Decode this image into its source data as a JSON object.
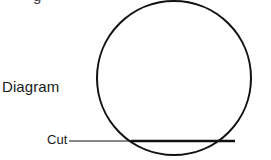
{
  "figure": {
    "title_clipped_above": "g",
    "background_color": "#ffffff",
    "stroke_color": "#111111",
    "labels": {
      "diagram": "Diagram",
      "cut": "Cut"
    },
    "shapes": {
      "circle": {
        "name": "circle-outline",
        "center_x": 174,
        "center_y": 78,
        "radius": 77,
        "stroke_width": 2
      },
      "cut_chord": {
        "name": "cut-chord-line",
        "x1": 131,
        "y1": 141,
        "x2": 235,
        "y2": 141,
        "stroke_width": 2.6
      },
      "leader_line": {
        "name": "cut-leader-line",
        "x1": 69,
        "y1": 141,
        "x2": 131,
        "y2": 141,
        "stroke_width": 1
      }
    }
  }
}
